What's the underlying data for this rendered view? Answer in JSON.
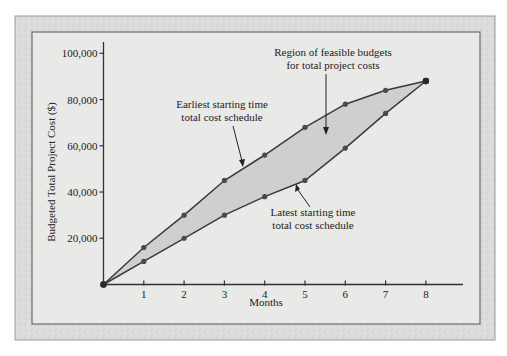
{
  "chart_data": {
    "type": "line",
    "title": "",
    "xlabel": "Months",
    "ylabel": "Budgeted Total Project Cost ($)",
    "x": [
      0,
      1,
      2,
      3,
      4,
      5,
      6,
      7,
      8
    ],
    "x_tick_labels": [
      "1",
      "2",
      "3",
      "4",
      "5",
      "6",
      "7",
      "8"
    ],
    "y_ticks": [
      20000,
      40000,
      60000,
      80000,
      100000
    ],
    "y_tick_labels": [
      "20,000",
      "40,000",
      "60,000",
      "80,000",
      "100,000"
    ],
    "xlim": [
      0,
      8.9
    ],
    "ylim": [
      0,
      105000
    ],
    "grid": false,
    "legend": null,
    "series": [
      {
        "name": "Earliest starting time total cost schedule",
        "values": [
          0,
          16000,
          30000,
          45000,
          56000,
          68000,
          78000,
          84000,
          88000
        ]
      },
      {
        "name": "Latest starting time total cost schedule",
        "values": [
          0,
          10000,
          20000,
          30000,
          38000,
          45000,
          59000,
          74000,
          88000
        ]
      }
    ],
    "fill_between": {
      "label": "Region of feasible budgets for total project costs"
    },
    "annotations": [
      {
        "id": "region",
        "lines": [
          "Region of feasible budgets",
          "for total project costs"
        ]
      },
      {
        "id": "earliest",
        "lines": [
          "Earliest starting time",
          "total cost schedule"
        ]
      },
      {
        "id": "latest",
        "lines": [
          "Latest starting time",
          "total cost schedule"
        ]
      }
    ]
  },
  "colors": {
    "frame_outer": "#d6d6d6",
    "panel": "#e8e8e6",
    "region_fill": "#cfcfcf",
    "line": "#3a3a3a",
    "marker": "#4a4a4a",
    "text": "#222222"
  }
}
